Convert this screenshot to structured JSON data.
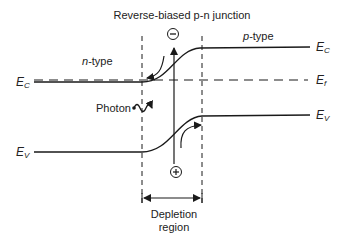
{
  "title": "Reverse-biased p-n junction",
  "labels": {
    "n_type": "n-type",
    "p_type": "p-type",
    "ec_left": "E",
    "ec_left_sub": "C",
    "ev_left": "E",
    "ev_left_sub": "V",
    "ec_right": "E",
    "ec_right_sub": "C",
    "ef_right": "E",
    "ef_right_sub": "f",
    "ev_right": "E",
    "ev_right_sub": "V",
    "photon": "Photon",
    "depletion_line1": "Depletion",
    "depletion_line2": "region",
    "electron_symbol": "−",
    "hole_symbol": "+"
  },
  "colors": {
    "line": "#1a1a1a",
    "background": "#ffffff"
  }
}
